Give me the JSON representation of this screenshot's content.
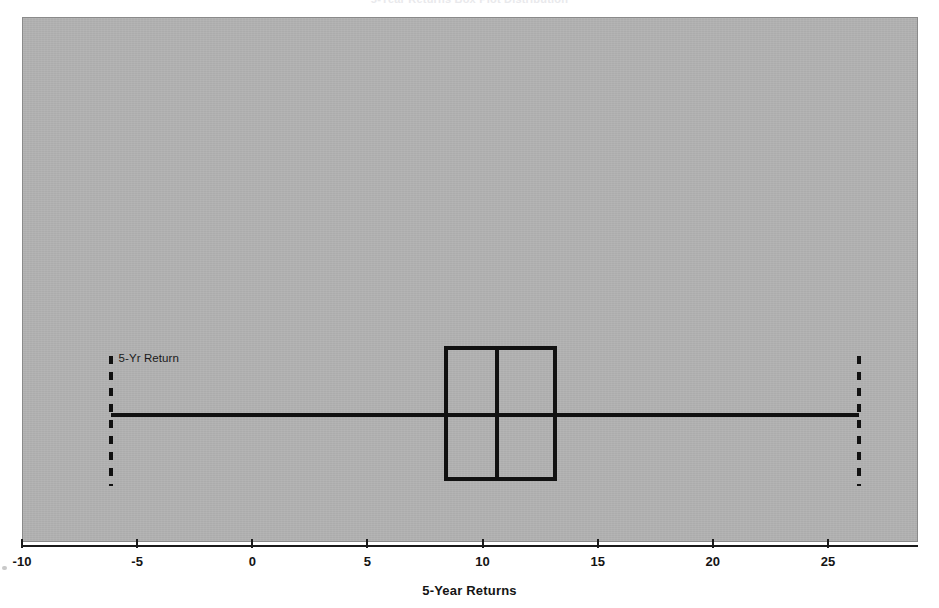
{
  "chart_data": {
    "type": "box",
    "title": "5-Year Returns Box Plot Distribution",
    "xlabel": "5-Year Returns",
    "ylabel": "",
    "xlim": [
      -10,
      27.5
    ],
    "grid": false,
    "legend": "none",
    "orientation": "horizontal",
    "xticks": [
      -10,
      -5,
      0,
      5,
      10,
      15,
      20,
      25
    ],
    "xtick_labels": [
      "-10",
      "-5",
      "0",
      "5",
      "10",
      "15",
      "20",
      "25"
    ],
    "series": [
      {
        "name": "5-Yr Return",
        "min": -6.2,
        "q1": 8.3,
        "median": 10.6,
        "q3": 13.2,
        "max": 26.3
      }
    ],
    "annotations": [
      {
        "text": "5-Yr Return",
        "x": -5.8,
        "y": 0.32
      }
    ],
    "panel_background": "#b2b2b2",
    "line_color": "#111111"
  },
  "axis": {
    "title": "5-Year Returns",
    "ticks": [
      {
        "label": "-10",
        "value": -10
      },
      {
        "label": "-5",
        "value": -5
      },
      {
        "label": "0",
        "value": 0
      },
      {
        "label": "5",
        "value": 5
      },
      {
        "label": "10",
        "value": 10
      },
      {
        "label": "15",
        "value": 15
      },
      {
        "label": "20",
        "value": 20
      },
      {
        "label": "25",
        "value": 25
      }
    ]
  },
  "box": {
    "series_label": "5-Yr Return"
  },
  "figure": {
    "title": "5-Year Returns Box Plot Distribution"
  }
}
